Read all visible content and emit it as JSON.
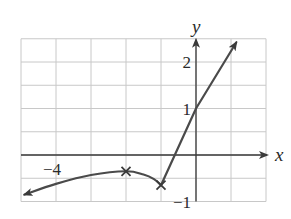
{
  "chart_data": {
    "type": "line",
    "title": "",
    "xlabel": "x",
    "ylabel": "y",
    "xlim": [
      -5,
      2
    ],
    "ylim": [
      -1,
      2.5
    ],
    "grid": true,
    "x_grid_step": 1,
    "y_grid_step": 0.5,
    "x_tick_labels": [
      {
        "value": -4,
        "label": "−4"
      }
    ],
    "y_tick_labels": [
      {
        "value": 2,
        "label": "2"
      },
      {
        "value": 1,
        "label": "1"
      },
      {
        "value": -1,
        "label": "−1"
      }
    ],
    "series": [
      {
        "name": "left-branch",
        "description": "curve rising to a local maximum then falling to a cusp",
        "arrow_start": true,
        "points": [
          {
            "x": -4.9,
            "y": -0.85
          },
          {
            "x": -4.0,
            "y": -0.62
          },
          {
            "x": -3.0,
            "y": -0.43
          },
          {
            "x": -2.0,
            "y": -0.35
          },
          {
            "x": -1.5,
            "y": -0.42
          },
          {
            "x": -1.2,
            "y": -0.52
          },
          {
            "x": -1.0,
            "y": -0.65
          }
        ]
      },
      {
        "name": "right-branch",
        "description": "straight line from cusp through (0,1)",
        "arrow_end": true,
        "points": [
          {
            "x": -1.0,
            "y": -0.65
          },
          {
            "x": 0.0,
            "y": 1.0
          },
          {
            "x": 1.15,
            "y": 2.42
          }
        ]
      }
    ],
    "markers": [
      {
        "name": "local-maximum",
        "x": -2.0,
        "y": -0.35,
        "symbol": "x"
      },
      {
        "name": "cusp-minimum",
        "x": -1.0,
        "y": -0.65,
        "symbol": "x"
      }
    ]
  }
}
